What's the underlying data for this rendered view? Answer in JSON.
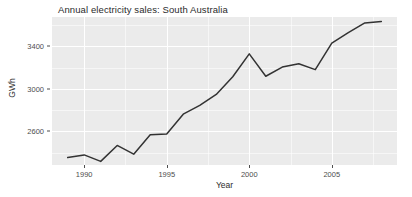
{
  "chart_data": {
    "type": "line",
    "title": "Annual electricity sales: South Australia",
    "xlabel": "Year",
    "ylabel": "GWh",
    "x": [
      1989,
      1990,
      1991,
      1992,
      1993,
      1994,
      1995,
      1996,
      1997,
      1998,
      1999,
      2000,
      2001,
      2002,
      2003,
      2004,
      2005,
      2006,
      2007,
      2008
    ],
    "values": [
      2354,
      2379,
      2318,
      2468,
      2386,
      2569,
      2575,
      2762,
      2844,
      2948,
      3114,
      3329,
      3119,
      3205,
      3237,
      3181,
      3430,
      3529,
      3620,
      3633
    ],
    "series": [
      {
        "name": "Annual electricity sales",
        "values": [
          2354,
          2379,
          2318,
          2468,
          2386,
          2569,
          2575,
          2762,
          2844,
          2948,
          3114,
          3329,
          3119,
          3205,
          3237,
          3181,
          3430,
          3529,
          3620,
          3633
        ]
      }
    ],
    "xlim": [
      1988.05,
      2008.95
    ],
    "ylim": [
      2284,
      3676
    ],
    "xticks": [
      1990,
      1995,
      2000,
      2005
    ],
    "xtick_labels": [
      "1990",
      "1995",
      "2000",
      "2005"
    ],
    "yticks": [
      2600,
      3000,
      3400
    ],
    "ytick_labels": [
      "2600",
      "3000",
      "3400"
    ],
    "xminor_ticks": [
      1992.5,
      1997.5,
      2002.5,
      2007.5
    ],
    "yminor_ticks": [
      2400,
      2800,
      3200,
      3600
    ],
    "grid": true,
    "legend": false,
    "line_color": "#333333",
    "panel_background": "#ebebeb",
    "grid_color": "#ffffff"
  }
}
